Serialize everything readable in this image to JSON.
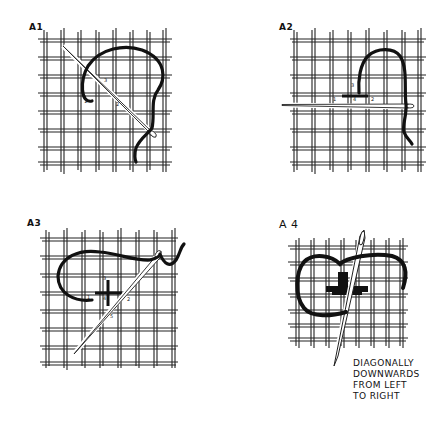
{
  "diagram": {
    "type": "embroidery stitch instructions",
    "panels": [
      {
        "id": "A1",
        "label": "A1",
        "step_numbers": [
          "1",
          "2",
          "3"
        ],
        "description": "Needle enters diagonally; thread loops up and around"
      },
      {
        "id": "A2",
        "label": "A2",
        "step_numbers": [
          "1",
          "2",
          "3",
          "4"
        ],
        "description": "Horizontal stitch with needle passing right to left"
      },
      {
        "id": "A3",
        "label": "A3",
        "step_numbers": [
          "1",
          "2",
          "3",
          "4",
          "5"
        ],
        "description": "Cross formed; needle passes diagonally"
      },
      {
        "id": "A4",
        "label": "A 4",
        "step_numbers": [],
        "description": "Completed stitch with needle passing diagonally"
      }
    ],
    "caption": {
      "lines": [
        "DIAGONALLY",
        "DOWNWARDS",
        "FROM LEFT",
        "TO RIGHT"
      ]
    },
    "colors": {
      "thread": "#111111",
      "grid": "#222222",
      "background": "#ffffff"
    }
  }
}
